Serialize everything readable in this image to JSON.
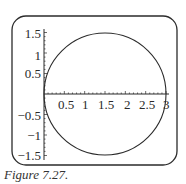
{
  "caption": "Figure 7.27.",
  "chart_data": {
    "type": "line",
    "title": "",
    "xlabel": "",
    "ylabel": "",
    "series": [
      {
        "name": "circle",
        "center": [
          1.5,
          0
        ],
        "radius": 1.5,
        "points": [
          [
            0,
            0
          ],
          [
            0.2,
            0.714
          ],
          [
            0.5,
            1.118
          ],
          [
            1.0,
            1.414
          ],
          [
            1.5,
            1.5
          ],
          [
            2.0,
            1.414
          ],
          [
            2.5,
            1.118
          ],
          [
            2.8,
            0.714
          ],
          [
            3.0,
            0
          ],
          [
            2.8,
            -0.714
          ],
          [
            2.5,
            -1.118
          ],
          [
            2.0,
            -1.414
          ],
          [
            1.5,
            -1.5
          ],
          [
            1.0,
            -1.414
          ],
          [
            0.5,
            -1.118
          ],
          [
            0.2,
            -0.714
          ],
          [
            0,
            0
          ]
        ]
      }
    ],
    "x_ticks": [
      "0.5",
      "1",
      "1.5",
      "2",
      "2.5",
      "3"
    ],
    "y_ticks": [
      "1.5",
      "1",
      "0.5",
      "-0.5",
      "-1",
      "-1.5"
    ],
    "x_tick_values": [
      0.5,
      1,
      1.5,
      2,
      2.5,
      3
    ],
    "y_tick_values": [
      1.5,
      1,
      0.5,
      -0.5,
      -1,
      -1.5
    ],
    "xlim": [
      0,
      3.05
    ],
    "ylim": [
      -1.55,
      1.55
    ],
    "grid": false,
    "legend": null,
    "frame": "rounded-rectangle"
  },
  "labels": {
    "x": [
      "0.5",
      "1",
      "1.5",
      "2",
      "2.5",
      "3"
    ],
    "y": [
      "1.5",
      "1",
      "0.5",
      "−0.5",
      "−1",
      "−1.5"
    ]
  }
}
